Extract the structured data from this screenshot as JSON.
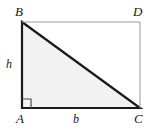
{
  "figure": {
    "kind": "geometry-diagram",
    "width": 154,
    "height": 131,
    "background_color": "#ffffff"
  },
  "labels": {
    "vertex_top_left": "B",
    "vertex_top_right": "D",
    "vertex_bottom_left": "A",
    "vertex_bottom_right": "C",
    "side_vertical": "h",
    "side_horizontal": "b"
  },
  "colors": {
    "triangle_fill": "#f2f2f2",
    "triangle_stroke": "#1a1a1a",
    "rectangle_stroke": "#9a9a9a",
    "label_color": "#1a1a1a",
    "right_angle_stroke": "#4d4d4d"
  },
  "geometry": {
    "rectangle": {
      "left": 22,
      "top": 22,
      "right": 140,
      "bottom": 108,
      "corners": {
        "B": [
          22,
          22
        ],
        "D": [
          140,
          22
        ],
        "C": [
          140,
          108
        ],
        "A": [
          22,
          108
        ]
      }
    },
    "triangle": {
      "vertices": {
        "B": [
          22,
          22
        ],
        "A": [
          22,
          108
        ],
        "C": [
          140,
          108
        ]
      },
      "points": "22,22 22,108 140,108",
      "stroke_width": 2.2
    },
    "right_angle_marker": {
      "at_vertex": "A",
      "size": 9,
      "path": "M 22 99 L 31 99 L 31 108"
    },
    "rectangle_open_path": {
      "path": "M 22 22 L 140 22 L 140 108",
      "stroke_width": 1
    }
  }
}
